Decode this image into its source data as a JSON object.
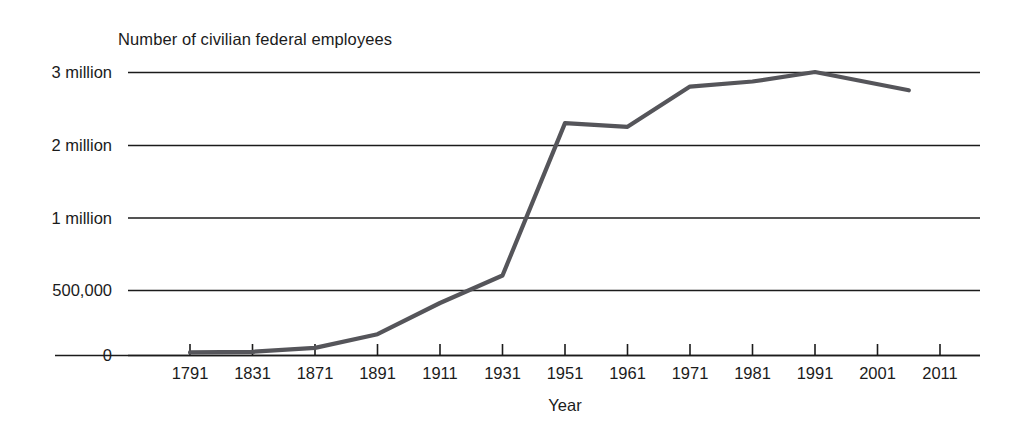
{
  "chart_data": {
    "type": "line",
    "title": "Number of civilian federal employees",
    "xlabel": "Year",
    "ylabel": "",
    "grid": true,
    "legend": false,
    "line_color": "#55555a",
    "axis_color": "#1b1b1b",
    "categories": [
      "1791",
      "1831",
      "1871",
      "1891",
      "1911",
      "1931",
      "1951",
      "1961",
      "1971",
      "1981",
      "1991",
      "2001",
      "2011"
    ],
    "ytick_labels": [
      "0",
      "500,000",
      "1 million",
      "2 million",
      "3 million"
    ],
    "ytick_values": [
      0,
      500000,
      1000000,
      2000000,
      3000000
    ],
    "yaxis_scale": "non-linear (evenly spaced gridlines at 0, 500,000, 1 million, 2 million, 3 million)",
    "ylim": [
      0,
      3000000
    ],
    "series": [
      {
        "name": "Civilian federal employees",
        "points": [
          {
            "x": "1791",
            "value": 20000
          },
          {
            "x": "1831",
            "value": 25000
          },
          {
            "x": "1871",
            "value": 55000
          },
          {
            "x": "1891",
            "value": 160000
          },
          {
            "x": "1911",
            "value": 400000
          },
          {
            "x": "1931",
            "value": 600000
          },
          {
            "x": "1951",
            "value": 2300000
          },
          {
            "x": "1961",
            "value": 2250000
          },
          {
            "x": "1971",
            "value": 2800000
          },
          {
            "x": "1981",
            "value": 2870000
          },
          {
            "x": "1991",
            "value": 3000000
          },
          {
            "x": "2006",
            "value": 2750000
          }
        ]
      }
    ],
    "annotations": []
  }
}
